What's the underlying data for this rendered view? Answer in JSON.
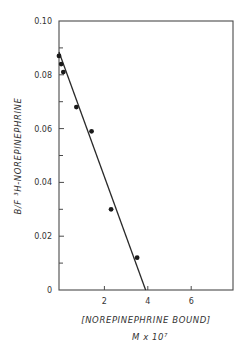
{
  "chart_data": {
    "type": "scatter",
    "title": "",
    "xlabel": "[NOREPINEPHRINE BOUND]",
    "xlabel_units": "M x 10⁷",
    "ylabel": "B/F ³H-NOREPINEPHRINE",
    "xlim": [
      0,
      8
    ],
    "ylim": [
      0,
      0.1
    ],
    "xticks": [
      2,
      4,
      6
    ],
    "xtick_labels": [
      "2",
      "4",
      "6"
    ],
    "yticks": [
      0,
      0.02,
      0.04,
      0.06,
      0.08,
      0.1
    ],
    "ytick_labels": [
      "0",
      "0.02",
      "0.04",
      "0.06",
      "0.08",
      "0.10"
    ],
    "yminor_ticks": [
      0.01,
      0.03,
      0.05,
      0.07,
      0.09
    ],
    "grid": false,
    "legend": null,
    "series": [
      {
        "name": "data points",
        "marker": "filled-circle",
        "x": [
          0.0,
          0.1,
          0.2,
          0.8,
          1.5,
          2.4,
          3.6
        ],
        "y": [
          0.087,
          0.084,
          0.081,
          0.068,
          0.059,
          0.03,
          0.012
        ]
      },
      {
        "name": "fit line",
        "type": "line",
        "x": [
          0.0,
          3.9
        ],
        "y": [
          0.0885,
          0.0
        ]
      }
    ]
  },
  "labels": {
    "xlabel_line1": "[NOREPINEPHRINE   BOUND]",
    "xlabel_line2": "M x 10⁷",
    "ylabel": "B/F   ³H-NOREPINEPHRINE"
  }
}
